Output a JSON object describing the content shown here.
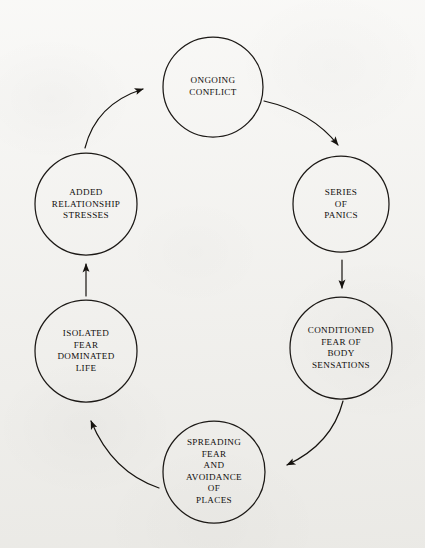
{
  "page": {
    "background_color": "#f2f1ed",
    "ink_color": "#12100e",
    "width": 425,
    "height": 548
  },
  "diagram": {
    "type": "cycle-diagram",
    "title": "",
    "node_count": 6,
    "direction": "clockwise",
    "nodes": [
      {
        "id": "ongoing-conflict",
        "label": "ONGOING\nCONFLICT",
        "cx": 213,
        "cy": 87,
        "r": 50,
        "position": "top"
      },
      {
        "id": "series-of-panics",
        "label": "SERIES\nOF\nPANICS",
        "cx": 341,
        "cy": 204,
        "r": 48,
        "position": "upper-right"
      },
      {
        "id": "conditioned-fear-of-body-sensations",
        "label": "CONDITIONED\nFEAR OF\nBODY\nSENSATIONS",
        "cx": 341,
        "cy": 348,
        "r": 51,
        "position": "lower-right"
      },
      {
        "id": "spreading-fear-and-avoidance-of-places",
        "label": "SPREADING\nFEAR\nAND\nAVOIDANCE\nOF\nPLACES",
        "cx": 214,
        "cy": 472,
        "r": 51,
        "position": "bottom"
      },
      {
        "id": "isolated-fear-dominated-life",
        "label": "ISOLATED\nFEAR\nDOMINATED\nLIFE",
        "cx": 86,
        "cy": 351,
        "r": 51,
        "position": "lower-left"
      },
      {
        "id": "added-relationship-stresses",
        "label": "ADDED\nRELATIONSHIP\nSTRESSES",
        "cx": 86,
        "cy": 204,
        "r": 51,
        "position": "upper-left"
      }
    ],
    "arrows": [
      {
        "id": "arrow-conflict-to-panics",
        "from": "ongoing-conflict",
        "to": "series-of-panics",
        "style": "curved"
      },
      {
        "id": "arrow-panics-to-conditioned-fear",
        "from": "series-of-panics",
        "to": "conditioned-fear-of-body-sensations",
        "style": "straight"
      },
      {
        "id": "arrow-conditioned-fear-to-spreading-fear",
        "from": "conditioned-fear-of-body-sensations",
        "to": "spreading-fear-and-avoidance-of-places",
        "style": "curved"
      },
      {
        "id": "arrow-spreading-fear-to-isolated-life",
        "from": "spreading-fear-and-avoidance-of-places",
        "to": "isolated-fear-dominated-life",
        "style": "curved"
      },
      {
        "id": "arrow-isolated-life-to-relationship-stresses",
        "from": "isolated-fear-dominated-life",
        "to": "added-relationship-stresses",
        "style": "straight"
      },
      {
        "id": "arrow-relationship-stresses-to-conflict",
        "from": "added-relationship-stresses",
        "to": "ongoing-conflict",
        "style": "curved"
      }
    ]
  }
}
